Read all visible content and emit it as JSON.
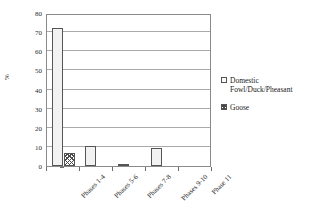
{
  "chart_data": {
    "type": "bar",
    "title": "",
    "subtitle": "",
    "xlabel": "",
    "ylabel": "%",
    "ylim": [
      0,
      80
    ],
    "ytick_step": 10,
    "yticks": [
      0,
      10,
      20,
      30,
      40,
      50,
      60,
      70,
      80
    ],
    "ytick_labels": [
      "0",
      "10",
      "20",
      "30",
      "40",
      "50",
      "60",
      "70",
      "80"
    ],
    "grid": true,
    "grid_axis": "y",
    "legend_position": "right",
    "categories": [
      "Phases 1-4",
      "Phases 5-6",
      "Phases 7-8",
      "Phases 9-10",
      "Phase 11"
    ],
    "series": [
      {
        "name": "Domestic Fowl/Duck/Pheasant",
        "pattern": "solid-light",
        "values": [
          72,
          10.3,
          1,
          9.5,
          0
        ]
      },
      {
        "name": "Goose",
        "pattern": "cross-hatch",
        "values": [
          7,
          0,
          0,
          0,
          0
        ]
      }
    ]
  },
  "legend": {
    "entries": [
      {
        "label": "Domestic Fowl/Duck/Pheasant",
        "swatch": "series-fowl"
      },
      {
        "label": "Goose",
        "swatch": "series-goose"
      }
    ]
  },
  "colors": {
    "axis": "#8a8a8a",
    "gridline": "#a9a9a9",
    "bar_fowl": "#f2f2f2",
    "bar_goose_hatch": "#4a4a4a",
    "bar_outline": "#555555",
    "text": "#1a1a1a",
    "background": "#ffffff"
  }
}
